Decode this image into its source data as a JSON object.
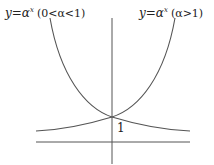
{
  "diagram": {
    "type": "exponential-function-graphs",
    "stroke_color": "#555555",
    "text_color": "#222222",
    "labels": {
      "left_curve": {
        "lhs": "y",
        "equals": "=",
        "base": "α",
        "exponent": "x",
        "condition": "(0<α<1)"
      },
      "right_curve": {
        "lhs": "y",
        "equals": "=",
        "base": "α",
        "exponent": "x",
        "condition": "(α>1)"
      },
      "intercept": "1"
    },
    "axes": {
      "x_axis": {
        "x1": 36,
        "y1": 142,
        "x2": 190,
        "y2": 142
      },
      "y_axis": {
        "x1": 112,
        "y1": 18,
        "x2": 112,
        "y2": 164
      }
    },
    "curves": [
      {
        "name": "decreasing-exponential",
        "condition": "0<α<1",
        "path": "M 50 18 C 60 75, 85 108, 112 117 C 135 124, 165 130, 190 131"
      },
      {
        "name": "increasing-exponential",
        "condition": "α>1",
        "path": "M 175 18 C 165 75, 140 108, 112 117 C 89 124, 60 130, 36 131"
      }
    ],
    "intersection_point": {
      "x": 112,
      "y": 117
    }
  }
}
